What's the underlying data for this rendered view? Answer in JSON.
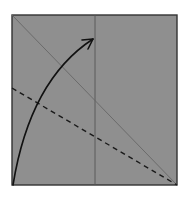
{
  "diagram": {
    "type": "origami-fold-diagram",
    "canvas": {
      "width": 187,
      "height": 198,
      "background": "#ffffff"
    },
    "paper": {
      "x": 12,
      "y": 15,
      "width": 165,
      "height": 170,
      "fill": "#8f8f8f",
      "stroke": "#333333",
      "stroke_width": 1.4
    },
    "lines": [
      {
        "name": "vertical-crease",
        "style": "solid",
        "x1": 95,
        "y1": 15,
        "x2": 95,
        "y2": 185,
        "color": "#555555",
        "width": 0.9
      },
      {
        "name": "diagonal-crease",
        "style": "solid",
        "x1": 12,
        "y1": 15,
        "x2": 177,
        "y2": 185,
        "color": "#666666",
        "width": 0.9
      },
      {
        "name": "valley-fold-line",
        "style": "dashed",
        "x1": 12,
        "y1": 88,
        "x2": 177,
        "y2": 185,
        "color": "#1a1a1a",
        "width": 1.4,
        "dash": "5,4"
      }
    ],
    "arrow": {
      "name": "fold-arrow",
      "path": "M 13 185 Q 30 80 93 39",
      "color": "#111111",
      "width": 1.6,
      "head": {
        "tip_x": 93,
        "tip_y": 39
      }
    }
  }
}
